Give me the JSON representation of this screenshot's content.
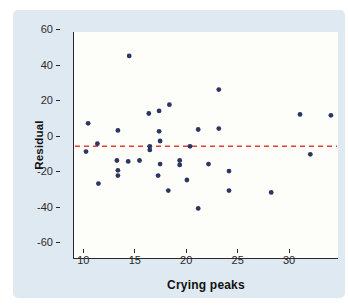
{
  "figure": {
    "page_background": "#ffffff",
    "card_background": "#dee9f2",
    "plot_background": "#fdfdfa",
    "axis_color": "#2a2a2a"
  },
  "chart_data": {
    "type": "scatter",
    "title": "",
    "xlabel": "Crying peaks",
    "ylabel": "Residual",
    "xlim": [
      7.83,
      33.49
    ],
    "ylim": [
      -63,
      64.5
    ],
    "x_ticks": [
      10,
      15,
      20,
      25,
      30
    ],
    "x_tick_labels": [
      "10",
      "15",
      "20",
      "25",
      "30"
    ],
    "y_ticks": [
      60,
      40,
      20,
      0,
      -20,
      -40,
      -60
    ],
    "y_tick_labels": [
      "60",
      "40",
      "20",
      "0",
      "-20",
      "-40",
      "-60"
    ],
    "grid": false,
    "legend": false,
    "point_color": "#2c3660",
    "point_radius": 2.4,
    "reference_line": {
      "y": 0,
      "style": "dashed",
      "color": "#e2402c"
    },
    "points": [
      [
        9.2,
        13
      ],
      [
        9.0,
        -3
      ],
      [
        10.1,
        1.5
      ],
      [
        10.2,
        -21
      ],
      [
        12.1,
        9
      ],
      [
        12.0,
        -8
      ],
      [
        12.1,
        -13.5
      ],
      [
        12.1,
        -16.5
      ],
      [
        13.2,
        51
      ],
      [
        13.1,
        -8.5
      ],
      [
        14.2,
        -8
      ],
      [
        15.1,
        18.5
      ],
      [
        15.2,
        0
      ],
      [
        15.2,
        -2
      ],
      [
        16.1,
        20
      ],
      [
        16.1,
        8.5
      ],
      [
        16.2,
        3
      ],
      [
        16.2,
        -10
      ],
      [
        16.0,
        -16.5
      ],
      [
        17.1,
        23.5
      ],
      [
        17.0,
        -25
      ],
      [
        18.1,
        -8
      ],
      [
        18.1,
        -10.5
      ],
      [
        18.8,
        -19
      ],
      [
        19.1,
        0
      ],
      [
        19.9,
        9.5
      ],
      [
        19.9,
        -35
      ],
      [
        20.9,
        -10
      ],
      [
        21.9,
        32
      ],
      [
        21.9,
        10
      ],
      [
        22.9,
        -14
      ],
      [
        22.9,
        -25
      ],
      [
        27.0,
        -26
      ],
      [
        29.8,
        18
      ],
      [
        30.8,
        -4.5
      ],
      [
        32.8,
        17.5
      ]
    ]
  }
}
